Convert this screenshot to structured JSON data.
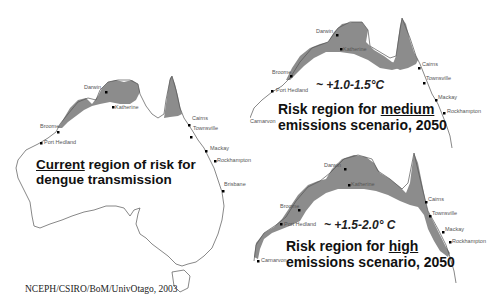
{
  "maps": {
    "current": {
      "caption_line1_emph": "Current",
      "caption_line1_rest": " region of risk for",
      "caption_line2": "dengue transmission",
      "cities": [
        "Darwin",
        "Katherine",
        "Broome",
        "Port Hedland",
        "Cairns",
        "Townsville",
        "Mackay",
        "Rockhampton",
        "Brisbane"
      ]
    },
    "medium": {
      "temperature": "~ +1.0-1.5°C",
      "caption_line1_prefix": "Risk region for ",
      "caption_line1_emph": "medium",
      "caption_line2": "emissions scenario, 2050",
      "cities": [
        "Darwin",
        "Katherine",
        "Broome",
        "Port Hedland",
        "Carnarvon",
        "Cairns",
        "Townsville",
        "Mackay",
        "Rockhampton"
      ]
    },
    "high": {
      "temperature": "~ +1.5-2.0° C",
      "caption_line1_prefix": "Risk region for ",
      "caption_line1_emph": "high",
      "caption_line2": "emissions scenario, 2050",
      "cities": [
        "Darwin",
        "Katherine",
        "Broome",
        "Port Hedland",
        "Carnarvon",
        "Cairns",
        "Townsville",
        "Mackay",
        "Rockhampton"
      ]
    }
  },
  "credit": "NCEPH/CSIRO/BoM/UnivOtago, 2003",
  "colors": {
    "risk_fill": "#8c8c8c",
    "coastline": "#555555",
    "city_marker": "#000000"
  }
}
